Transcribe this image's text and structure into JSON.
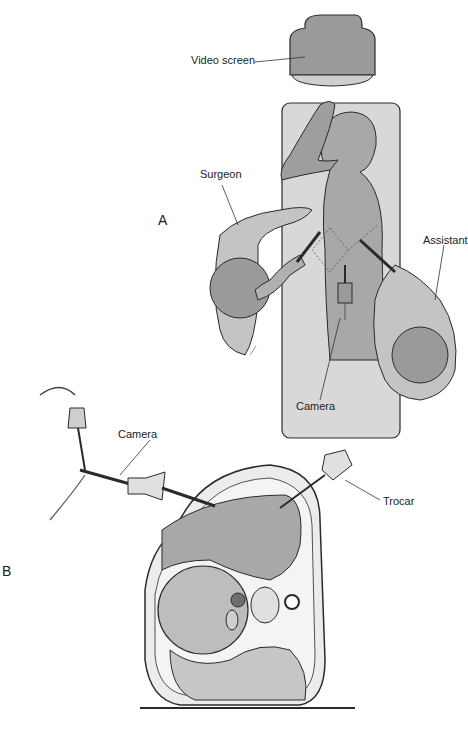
{
  "figure": {
    "panels": [
      {
        "id": "A",
        "label": "A"
      },
      {
        "id": "B",
        "label": "B"
      }
    ],
    "labels": {
      "video_screen": "Video screen",
      "surgeon": "Surgeon",
      "assistant": "Assistant",
      "camera_a": "Camera",
      "camera_b": "Camera",
      "trocar": "Trocar"
    },
    "colors": {
      "fill_dark": "#8c8c8c",
      "fill_mid": "#b4b4b4",
      "fill_light": "#dcdcdc",
      "outline": "#2a2a2a"
    }
  }
}
